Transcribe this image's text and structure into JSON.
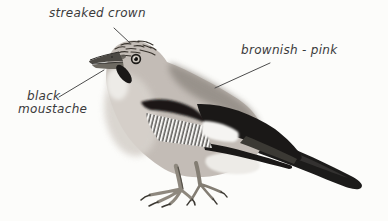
{
  "figure": {
    "background_color": "#fcfcfa",
    "ink_color": "#3a3a3a",
    "leader_line_color": "#4d4d4d"
  },
  "labels": {
    "crown": "streaked crown",
    "plumage": "brownish - pink",
    "moustache_line1": "black",
    "moustache_line2": "moustache"
  },
  "bird_colors": {
    "body": "#c3bcb6",
    "breast": "#d7d2cc",
    "throat": "#edebe7",
    "mantle": "#948e87",
    "wing_black": "#1a1817",
    "wing_white": "#f5f4f2",
    "tail_black": "#1c1b1a",
    "bill_upper": "#4c4944",
    "bill_lower": "#6e6a62",
    "feet": "#8e887e",
    "crown_streaks": "#38332d"
  }
}
